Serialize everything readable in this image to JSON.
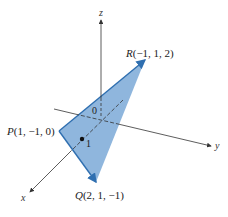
{
  "diagram": {
    "type": "3d-coordinate-triangle",
    "colors": {
      "triangle_fill": "#8fb6dd",
      "triangle_edge": "#2f6fb0",
      "axis": "#333333",
      "background": "#ffffff"
    },
    "axes": {
      "x_label": "x",
      "y_label": "y",
      "z_label": "z",
      "origin_label": "0",
      "unit_tick_label": "1"
    },
    "points": [
      {
        "name": "P",
        "coords": "(1, −1, 0)"
      },
      {
        "name": "Q",
        "coords": "(2, 1, −1)"
      },
      {
        "name": "R",
        "coords": "(−1, 1, 2)"
      }
    ]
  }
}
